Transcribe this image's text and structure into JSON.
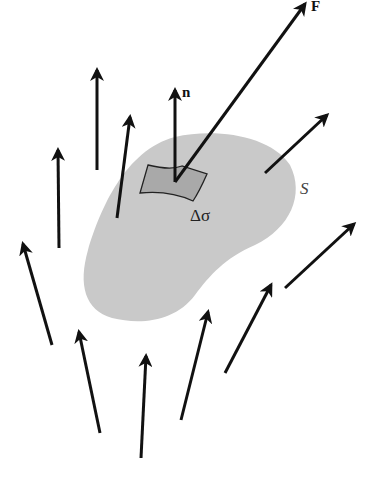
{
  "diagram": {
    "labels": {
      "force": "F",
      "normal": "n",
      "patch": "Δσ",
      "surface": "S"
    },
    "colors": {
      "surface_fill": "#c9c9c9",
      "patch_fill": "#a9a9a9",
      "arrow": "#111111",
      "background": "#ffffff"
    },
    "arrows": [
      {
        "name": "F",
        "from": [
          175,
          180
        ],
        "to": [
          305,
          4
        ]
      },
      {
        "name": "n",
        "from": [
          175,
          180
        ],
        "to": [
          175,
          90
        ]
      },
      {
        "from": [
          97,
          170
        ],
        "to": [
          97,
          70
        ]
      },
      {
        "from": [
          117,
          218
        ],
        "to": [
          130,
          117
        ]
      },
      {
        "from": [
          59,
          248
        ],
        "to": [
          58,
          150
        ]
      },
      {
        "from": [
          52,
          345
        ],
        "to": [
          23,
          244
        ]
      },
      {
        "from": [
          100,
          433
        ],
        "to": [
          79,
          332
        ]
      },
      {
        "from": [
          141,
          458
        ],
        "to": [
          146,
          356
        ]
      },
      {
        "from": [
          181,
          420
        ],
        "to": [
          208,
          312
        ]
      },
      {
        "from": [
          225,
          373
        ],
        "to": [
          271,
          285
        ]
      },
      {
        "from": [
          265,
          173
        ],
        "to": [
          327,
          115
        ]
      },
      {
        "from": [
          285,
          288
        ],
        "to": [
          354,
          224
        ]
      }
    ]
  }
}
